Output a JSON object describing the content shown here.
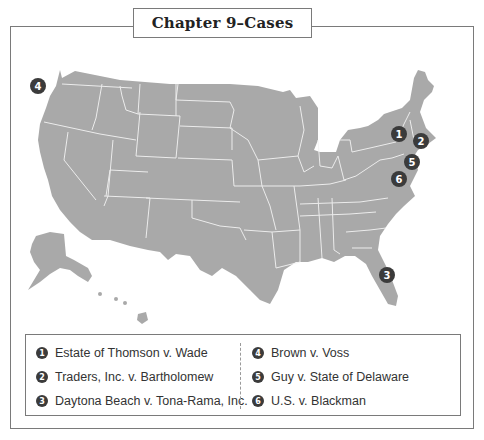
{
  "title": "Chapter 9–Cases",
  "colors": {
    "map_fill": "#a9a9a9",
    "state_border": "#ffffff",
    "marker": "#3b3b3b",
    "frame": "#7a7a7a"
  },
  "markers": [
    {
      "num": "1",
      "case": "Estate of Thomson v. Wade",
      "x": 391,
      "y": 126
    },
    {
      "num": "2",
      "case": "Traders, Inc. v. Bartholomew",
      "x": 413,
      "y": 133
    },
    {
      "num": "3",
      "case": "Daytona Beach v. Tona-Rama, Inc.",
      "x": 379,
      "y": 267
    },
    {
      "num": "4",
      "case": "Brown v. Voss",
      "x": 30,
      "y": 78
    },
    {
      "num": "5",
      "case": "Guy v. State of Delaware",
      "x": 404,
      "y": 154
    },
    {
      "num": "6",
      "case": "U.S. v. Blackman",
      "x": 391,
      "y": 171
    }
  ],
  "legend": {
    "left": [
      {
        "num": "1",
        "label": "Estate of Thomson v. Wade"
      },
      {
        "num": "2",
        "label": "Traders, Inc. v. Bartholomew"
      },
      {
        "num": "3",
        "label": "Daytona Beach v. Tona-Rama, Inc."
      }
    ],
    "right": [
      {
        "num": "4",
        "label": "Brown v. Voss"
      },
      {
        "num": "5",
        "label": "Guy v. State of Delaware"
      },
      {
        "num": "6",
        "label": "U.S. v. Blackman"
      }
    ]
  }
}
